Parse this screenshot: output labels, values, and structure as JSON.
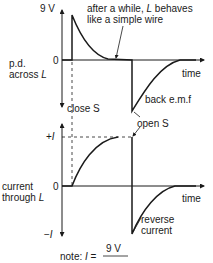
{
  "top_graph": {
    "y_label_line1": "p.d.",
    "y_label_line2": "across",
    "y_label_var": "L",
    "y_max_label": "9 V",
    "origin_label": "0",
    "x_label": "time",
    "annotation_wire_line1_a": "after a while, ",
    "annotation_wire_var": "L",
    "annotation_wire_line1_b": " behaves",
    "annotation_wire_line2": "like a simple wire",
    "annotation_back_emf": "back e.m.f",
    "annotation_close": "close S",
    "annotation_open": "open S"
  },
  "bottom_graph": {
    "y_label_line1": "current",
    "y_label_line2": "through",
    "y_label_var": "L",
    "y_max_label": "+I",
    "y_min_label": "−I",
    "origin_label": "0",
    "x_label": "time",
    "annotation_reverse_line1": "reverse",
    "annotation_reverse_line2": "current"
  },
  "note": {
    "prefix": "note: ",
    "var": "I",
    "eq": " = ",
    "numerator": "9 V"
  },
  "colors": {
    "ink": "#1a1a1a",
    "background": "#ffffff"
  }
}
